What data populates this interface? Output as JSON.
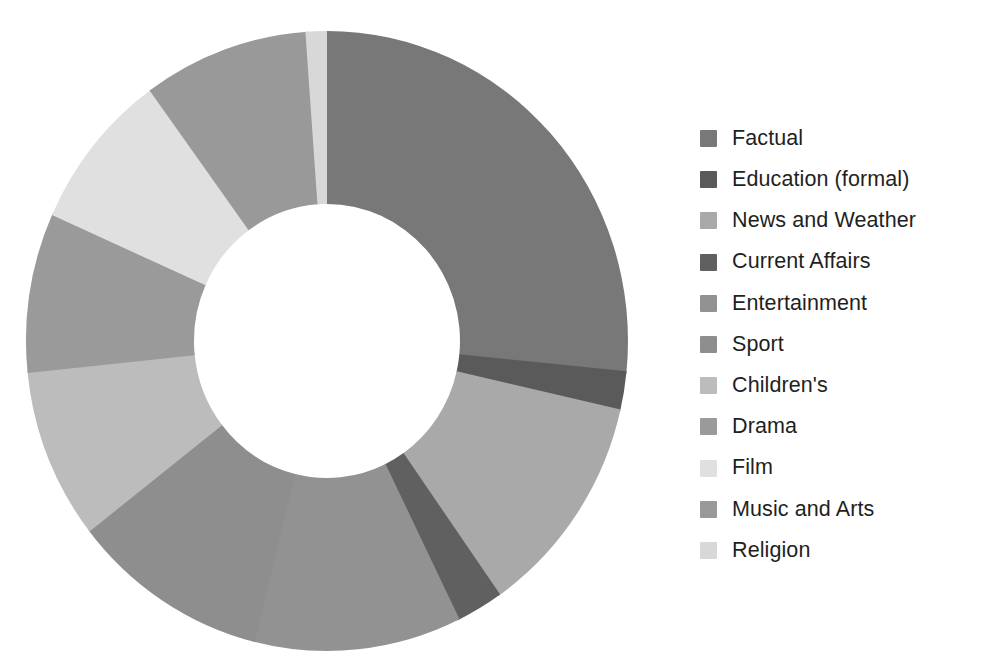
{
  "figure": {
    "title": "",
    "background_color": "#ffffff"
  },
  "legend": {
    "position": "right",
    "items": [
      {
        "label": "Factual",
        "color": "#787878"
      },
      {
        "label": "Education (formal)",
        "color": "#5a5a5a"
      },
      {
        "label": "News and Weather",
        "color": "#a9a9a9"
      },
      {
        "label": "Current Affairs",
        "color": "#606060"
      },
      {
        "label": "Entertainment",
        "color": "#929292"
      },
      {
        "label": "Sport",
        "color": "#8e8e8e"
      },
      {
        "label": "Children's",
        "color": "#bcbcbc"
      },
      {
        "label": "Drama",
        "color": "#9a9a9a"
      },
      {
        "label": "Film",
        "color": "#e0e0e0"
      },
      {
        "label": "Music and Arts",
        "color": "#999999"
      },
      {
        "label": "Religion",
        "color": "#d8d8d8"
      }
    ]
  },
  "chart_data": {
    "type": "pie",
    "variant": "donut",
    "title": "",
    "xlabel": "",
    "ylabel": "",
    "start_angle_deg": 0,
    "direction": "clockwise",
    "inner_radius_ratio": 0.44,
    "grid": false,
    "legend_position": "right",
    "labels": [
      "Factual",
      "Education (formal)",
      "News and Weather",
      "Current Affairs",
      "Entertainment",
      "Sport",
      "Children's",
      "Drama",
      "Film",
      "Music and Arts",
      "Religion"
    ],
    "values": [
      26.6,
      2.0,
      11.7,
      2.5,
      11.1,
      10.6,
      8.9,
      8.3,
      8.3,
      8.9,
      1.1
    ],
    "colors": [
      "#787878",
      "#5a5a5a",
      "#a9a9a9",
      "#606060",
      "#929292",
      "#8e8e8e",
      "#bcbcbc",
      "#9a9a9a",
      "#e0e0e0",
      "#999999",
      "#d8d8d8"
    ],
    "units": "percent of total",
    "slices": [
      {
        "label": "Factual",
        "value": 26.6,
        "start_deg": 0.0,
        "end_deg": 95.8,
        "color": "#787878"
      },
      {
        "label": "Education (formal)",
        "value": 2.0,
        "start_deg": 95.8,
        "end_deg": 103.0,
        "color": "#5a5a5a"
      },
      {
        "label": "News and Weather",
        "value": 11.7,
        "start_deg": 103.0,
        "end_deg": 145.1,
        "color": "#a9a9a9"
      },
      {
        "label": "Current Affairs",
        "value": 2.5,
        "start_deg": 145.1,
        "end_deg": 154.1,
        "color": "#606060"
      },
      {
        "label": "Entertainment",
        "value": 11.1,
        "start_deg": 154.1,
        "end_deg": 194.1,
        "color": "#929292"
      },
      {
        "label": "Sport",
        "value": 10.6,
        "start_deg": 194.1,
        "end_deg": 232.3,
        "color": "#8e8e8e"
      },
      {
        "label": "Children's",
        "value": 8.9,
        "start_deg": 232.3,
        "end_deg": 264.3,
        "color": "#bcbcbc"
      },
      {
        "label": "Drama",
        "value": 8.3,
        "start_deg": 264.3,
        "end_deg": 294.2,
        "color": "#9a9a9a"
      },
      {
        "label": "Film",
        "value": 8.3,
        "start_deg": 294.2,
        "end_deg": 324.1,
        "color": "#e0e0e0"
      },
      {
        "label": "Music and Arts",
        "value": 8.9,
        "start_deg": 324.1,
        "end_deg": 356.1,
        "color": "#999999"
      },
      {
        "label": "Religion",
        "value": 1.1,
        "start_deg": 356.1,
        "end_deg": 360.0,
        "color": "#d8d8d8"
      }
    ]
  },
  "geometry": {
    "center_x": 327,
    "center_y": 341,
    "radius_x": 301,
    "radius_y": 310,
    "inner_radius_x": 133,
    "inner_radius_y": 137
  }
}
